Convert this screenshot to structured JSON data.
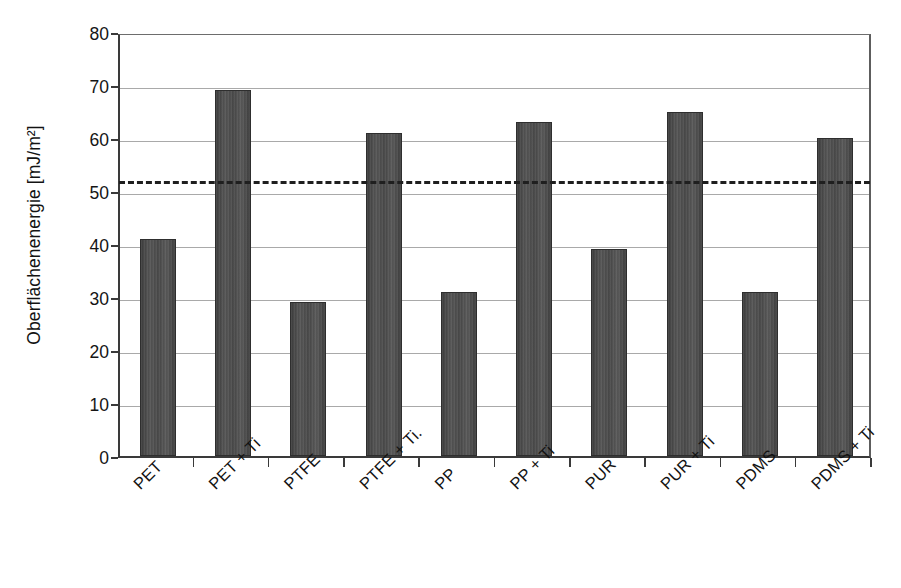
{
  "chart_data": {
    "type": "bar",
    "title": "",
    "subtitle": "",
    "xlabel": "",
    "ylabel": "Oberflächenenergie [mJ/m²]",
    "categories": [
      "PET",
      "PET + Ti",
      "PTFE",
      "PTFE + Ti.",
      "PP",
      "PP + Ti",
      "PUR",
      "PUR + Ti",
      "PDMS",
      "PDMS + Ti"
    ],
    "values": [
      41,
      69,
      29,
      61,
      31,
      63,
      39,
      65,
      31,
      60
    ],
    "ylim": [
      0,
      80
    ],
    "ytick_labels": [
      "0",
      "10",
      "20",
      "30",
      "40",
      "50",
      "60",
      "70",
      "80"
    ],
    "ytick_values": [
      0,
      10,
      20,
      30,
      40,
      50,
      60,
      70,
      80
    ],
    "grid": true,
    "grid_axis": "y",
    "legend": false,
    "legend_position": "none",
    "annotations": [
      {
        "name": "threshold-line",
        "type": "horizontal-dashed-line",
        "value": 52.5,
        "label": ""
      }
    ],
    "bar_color": "#4a4a4a",
    "bar_edge_color": "#2e2e2e",
    "grid_color": "#a9a9a9",
    "axis_color": "#3a3a3a",
    "annotation_color": "#1f1f1f",
    "background_color": "#ffffff",
    "xtick_label_rotation": -45
  }
}
